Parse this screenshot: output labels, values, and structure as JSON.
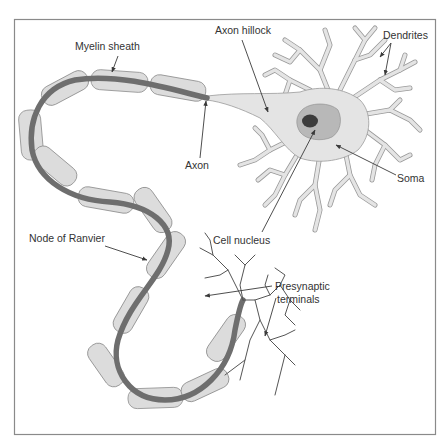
{
  "diagram": {
    "colors": {
      "frame": "#8a8a8a",
      "axon_core": "#6e6e6e",
      "myelin": "#dcdcdc",
      "cell_body": "#e4e4e4",
      "nucleus_outer": "#b8b8b8",
      "nucleolus": "#3c3c3c",
      "label_text": "#333333"
    },
    "labels": {
      "myelin_sheath": "Myelin sheath",
      "axon_hillock": "Axon hillock",
      "dendrites": "Dendrites",
      "axon": "Axon",
      "soma": "Soma",
      "cell_nucleus": "Cell nucleus",
      "node_of_ranvier": "Node of Ranvier",
      "presynaptic_line1": "Presynaptic",
      "presynaptic_line2": "terminals"
    }
  }
}
